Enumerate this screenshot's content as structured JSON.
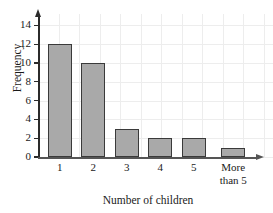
{
  "chart_data": {
    "type": "bar",
    "title": "",
    "xlabel": "Number of children",
    "ylabel": "Frequency",
    "categories": [
      "1",
      "2",
      "3",
      "4",
      "5",
      "More\nthan 5"
    ],
    "values": [
      12,
      10,
      3,
      2,
      2,
      1
    ],
    "ylim": [
      0,
      15
    ],
    "yticks": [
      0,
      2,
      4,
      6,
      8,
      10,
      12,
      14
    ],
    "ytick_labels": [
      "0",
      "2",
      "4",
      "6",
      "8",
      "10",
      "12",
      "14"
    ],
    "grid": true,
    "legend": null,
    "bar_color": "#a9a9a9",
    "bar_edge_color": "#3a3a3a",
    "grid_color": "#ededed",
    "axis_color": "#2b2b2b"
  },
  "axes": {
    "y_axis_name": "Frequency",
    "x_axis_name": "Number of children"
  }
}
